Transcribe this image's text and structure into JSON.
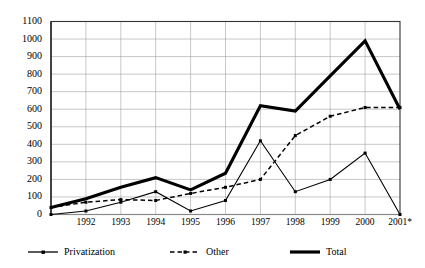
{
  "chart_data": {
    "type": "line",
    "title": "",
    "xlabel": "",
    "ylabel": "",
    "ylim": [
      0,
      1100
    ],
    "ytick_step": 100,
    "grid": true,
    "legend_position": "bottom",
    "categories": [
      "1991",
      "1992",
      "1993",
      "1994",
      "1995",
      "1996",
      "1997",
      "1998",
      "1999",
      "2000",
      "2001*"
    ],
    "x_tick_labels": [
      "1992",
      "1993",
      "1994",
      "1995",
      "1996",
      "1997",
      "1998",
      "1999",
      "2000",
      "2001*"
    ],
    "y_tick_labels": [
      "1100",
      "1000",
      "900",
      "800",
      "700",
      "600",
      "500",
      "400",
      "300",
      "200",
      "100",
      "0"
    ],
    "series": [
      {
        "name": "Privatization",
        "style": "solid-thin-square",
        "color": "#000000",
        "values": [
          0,
          20,
          70,
          130,
          20,
          80,
          420,
          130,
          200,
          350,
          0
        ]
      },
      {
        "name": "Other",
        "style": "dashed-square",
        "color": "#000000",
        "values": [
          40,
          70,
          85,
          80,
          120,
          155,
          200,
          450,
          560,
          610,
          610
        ]
      },
      {
        "name": "Total",
        "style": "solid-thick",
        "color": "#000000",
        "values": [
          40,
          90,
          155,
          210,
          140,
          235,
          620,
          590,
          790,
          990,
          600
        ]
      }
    ]
  },
  "legend": {
    "items": [
      {
        "label": "Privatization",
        "marker": "line-with-square-marker"
      },
      {
        "label": "Other",
        "marker": "dashed-line-with-square-marker"
      },
      {
        "label": "Total",
        "marker": "thick-solid-line"
      }
    ]
  }
}
